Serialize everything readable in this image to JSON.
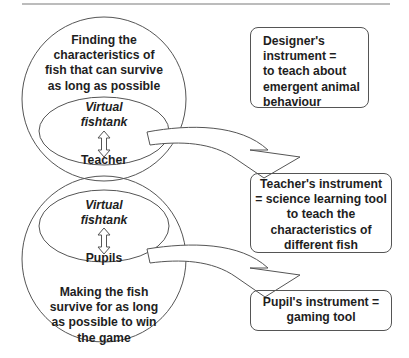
{
  "diagram": {
    "upper_circle": {
      "caption": "Finding the characteristics of fish that can survive as long as possible",
      "caption_lines": [
        "Finding the",
        "characteristics of",
        "fish that can survive",
        "as long as possible"
      ],
      "inner_ellipse": {
        "label_lines": [
          "Virtual",
          "fishtank"
        ],
        "arrow_icon": "up-down-double-arrow",
        "actor": "Teacher"
      }
    },
    "lower_circle": {
      "caption": "Making the fish survive for as long as possible to win the game",
      "caption_lines": [
        "Making the fish",
        "survive for as long",
        "as possible to win",
        "the game"
      ],
      "inner_ellipse": {
        "label_lines": [
          "Virtual",
          "fishtank"
        ],
        "arrow_icon": "up-down-double-arrow",
        "actor": "Pupils"
      }
    },
    "boxes": {
      "designer": {
        "lines": [
          "Designer's",
          "instrument =",
          "to teach about",
          "emergent animal",
          "behaviour"
        ]
      },
      "teacher": {
        "lines": [
          "Teacher's instrument",
          "= science learning tool",
          "to teach the",
          "characteristics of",
          "different fish"
        ]
      },
      "pupil": {
        "lines": [
          "Pupil's instrument =",
          "gaming tool"
        ]
      }
    },
    "arrows": [
      {
        "from": "teacher-ellipse",
        "to": "teacher-box",
        "style": "curved-hollow-arrow"
      },
      {
        "from": "pupils-ellipse",
        "to": "pupil-box",
        "style": "curved-hollow-arrow"
      }
    ],
    "colors": {
      "stroke": "#555555",
      "text": "#1e1e1e",
      "background": "#ffffff",
      "top_rule": "#7a7a7a"
    }
  }
}
